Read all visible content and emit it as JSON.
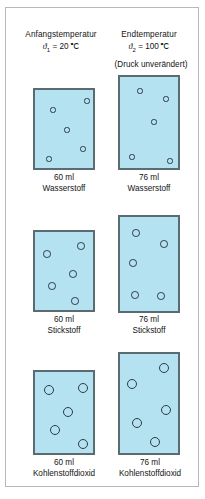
{
  "figure": {
    "header": {
      "left_title": "Anfangstemperatur",
      "right_title": "Endtemperatur",
      "left_temp_symbol": "ϑ",
      "left_temp_sub": "1",
      "left_temp_value": "= 20 ℃",
      "right_temp_symbol": "ϑ",
      "right_temp_sub": "2",
      "right_temp_value": "= 100 ℃",
      "pressure_note": "(Druck unverändert)"
    },
    "colors": {
      "vessel_fill": "#b5e2f0",
      "vessel_border": "#5b6b72",
      "particle_border": "#2c3b46",
      "frame_border": "#b8b8b8",
      "text": "#141414"
    },
    "rows": [
      {
        "substance": "Wasserstoff",
        "particle_radius_px": 2.6,
        "left": {
          "volume_label": "60 ml",
          "substance_label": "Wasserstoff",
          "box": {
            "x": 33,
            "y": 88,
            "w": 62,
            "h": 82
          },
          "particles": [
            {
              "x": 18,
              "y": 20
            },
            {
              "x": 52,
              "y": 11
            },
            {
              "x": 32,
              "y": 40
            },
            {
              "x": 48,
              "y": 59
            },
            {
              "x": 14,
              "y": 69
            }
          ]
        },
        "right": {
          "volume_label": "76 ml",
          "substance_label": "Wasserstoff",
          "box": {
            "x": 118,
            "y": 75,
            "w": 62,
            "h": 95
          },
          "particles": [
            {
              "x": 20,
              "y": 14
            },
            {
              "x": 46,
              "y": 22
            },
            {
              "x": 34,
              "y": 45
            },
            {
              "x": 12,
              "y": 80
            },
            {
              "x": 50,
              "y": 84
            }
          ]
        }
      },
      {
        "substance": "Stickstoff",
        "particle_radius_px": 3.8,
        "left": {
          "volume_label": "60 ml",
          "substance_label": "Stickstoff",
          "box": {
            "x": 33,
            "y": 230,
            "w": 62,
            "h": 82
          },
          "particles": [
            {
              "x": 12,
              "y": 22
            },
            {
              "x": 46,
              "y": 14
            },
            {
              "x": 38,
              "y": 42
            },
            {
              "x": 17,
              "y": 54
            },
            {
              "x": 40,
              "y": 69
            }
          ]
        },
        "right": {
          "volume_label": "76 ml",
          "substance_label": "Stickstoff",
          "box": {
            "x": 118,
            "y": 215,
            "w": 62,
            "h": 98
          },
          "particles": [
            {
              "x": 16,
              "y": 16
            },
            {
              "x": 44,
              "y": 27
            },
            {
              "x": 13,
              "y": 46
            },
            {
              "x": 15,
              "y": 78
            },
            {
              "x": 41,
              "y": 79
            }
          ]
        }
      },
      {
        "substance": "Kohlenstoffdioxid",
        "particle_radius_px": 5.2,
        "left": {
          "volume_label": "60 ml",
          "substance_label": "Kohlenstoffdioxid",
          "box": {
            "x": 33,
            "y": 370,
            "w": 62,
            "h": 85
          },
          "particles": [
            {
              "x": 14,
              "y": 18
            },
            {
              "x": 48,
              "y": 16
            },
            {
              "x": 33,
              "y": 40
            },
            {
              "x": 20,
              "y": 58
            },
            {
              "x": 48,
              "y": 72
            }
          ]
        },
        "right": {
          "volume_label": "76 ml",
          "substance_label": "Kohlenstoffdioxid",
          "box": {
            "x": 118,
            "y": 352,
            "w": 62,
            "h": 103
          },
          "particles": [
            {
              "x": 44,
              "y": 14
            },
            {
              "x": 12,
              "y": 30
            },
            {
              "x": 46,
              "y": 56
            },
            {
              "x": 17,
              "y": 69
            },
            {
              "x": 35,
              "y": 88
            }
          ]
        }
      }
    ],
    "captions": [
      {
        "x": 33,
        "y": 173,
        "w": 62,
        "volume": "60 ml",
        "substance": "Wasserstoff"
      },
      {
        "x": 118,
        "y": 173,
        "w": 62,
        "volume": "76 ml",
        "substance": "Wasserstoff"
      },
      {
        "x": 33,
        "y": 315,
        "w": 62,
        "volume": "60 ml",
        "substance": "Stickstoff"
      },
      {
        "x": 118,
        "y": 315,
        "w": 62,
        "volume": "76 ml",
        "substance": "Stickstoff"
      },
      {
        "x": 20,
        "y": 458,
        "w": 88,
        "volume": "60 ml",
        "substance": "Kohlenstoffdioxid"
      },
      {
        "x": 106,
        "y": 458,
        "w": 88,
        "volume": "76 ml",
        "substance": "Kohlenstoffdioxid"
      }
    ]
  }
}
